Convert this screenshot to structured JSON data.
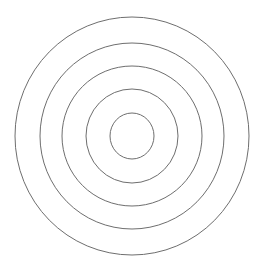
{
  "figure": {
    "background_color": "#ffffff",
    "canvas": {
      "width": 262,
      "height": 267
    },
    "center": {
      "x": 132,
      "y": 136
    },
    "stroke_color": "#6e6e6e",
    "stroke_width": 1
  },
  "chart_data": {
    "type": "scatter",
    "subtitle": "",
    "xlabel": "",
    "ylabel": "",
    "grid": false,
    "legend": "none",
    "xlim": [
      0,
      262
    ],
    "ylim": [
      0,
      267
    ],
    "center_x": 132,
    "center_y": 136,
    "series": [
      {
        "name": "ring-1-outer",
        "radius": 117,
        "radius_x": 117,
        "radius_y": 119,
        "stroke": "#6e6e6e",
        "fill": "none"
      },
      {
        "name": "ring-2",
        "radius": 92,
        "radius_x": 92,
        "radius_y": 93,
        "stroke": "#6e6e6e",
        "fill": "none"
      },
      {
        "name": "ring-3",
        "radius": 70,
        "radius_x": 70,
        "radius_y": 70,
        "stroke": "#6e6e6e",
        "fill": "none"
      },
      {
        "name": "ring-4",
        "radius": 46,
        "radius_x": 46,
        "radius_y": 47,
        "stroke": "#6e6e6e",
        "fill": "none"
      },
      {
        "name": "ring-5-inner",
        "radius": 22,
        "radius_x": 22,
        "radius_y": 23,
        "stroke": "#6e6e6e",
        "fill": "none"
      }
    ],
    "radii": [
      117,
      92,
      70,
      46,
      22
    ],
    "ring_gaps": [
      25,
      22,
      24,
      24
    ],
    "ring_count": 5
  }
}
